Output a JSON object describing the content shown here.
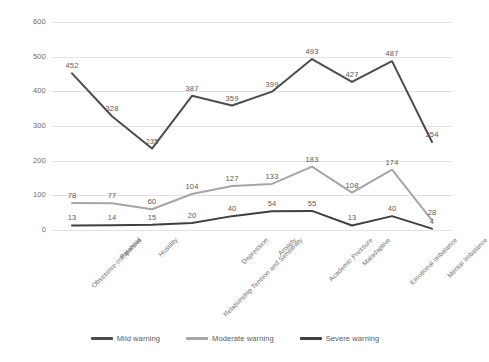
{
  "chart_data": {
    "type": "line",
    "title": "",
    "subtitle": "",
    "xlabel": "",
    "ylabel": "",
    "ylim": [
      0,
      600
    ],
    "yticks": [
      0,
      100,
      200,
      300,
      400,
      500,
      600
    ],
    "grid": true,
    "legend_position": "bottom",
    "categories": [
      "Obsessive-compulsive",
      "Paranoid",
      "Hostility",
      "Relationship Tension and Sensitivity",
      "Depression",
      "Anxiety",
      "Academic Pressure",
      "Maladaptive",
      "Emotional Imbalance",
      "Mental Imbalance"
    ],
    "series": [
      {
        "name": "Mild warning",
        "color": "#4d4d4d",
        "values": [
          452,
          328,
          235,
          387,
          359,
          399,
          493,
          427,
          487,
          254
        ]
      },
      {
        "name": "Moderate warning",
        "color": "#a6a6a6",
        "values": [
          78,
          77,
          60,
          104,
          127,
          133,
          183,
          108,
          174,
          28
        ]
      },
      {
        "name": "Severe warning",
        "color": "#404040",
        "values": [
          13,
          14,
          15,
          20,
          40,
          54,
          55,
          13,
          40,
          4
        ]
      }
    ]
  },
  "legend": {
    "items": [
      {
        "label": "Mild warning"
      },
      {
        "label": "Moderate warning"
      },
      {
        "label": "Severe warning"
      }
    ]
  }
}
